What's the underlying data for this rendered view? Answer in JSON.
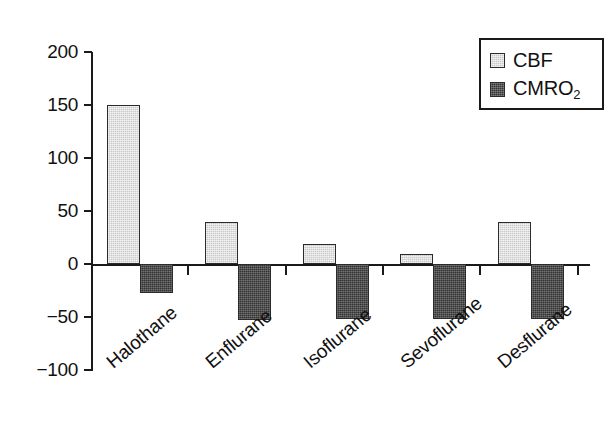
{
  "chart_data": {
    "type": "bar",
    "title": "",
    "subtitle": "",
    "xlabel": "",
    "ylabel": "",
    "categories": [
      "Halothane",
      "Enflurane",
      "Isoflurane",
      "Sevoflurane",
      "Desflurane"
    ],
    "series": [
      {
        "name": "CBF",
        "color": "#c9c9c9",
        "values": [
          150,
          40,
          19,
          9,
          40
        ]
      },
      {
        "name": "CMRO2",
        "color": "#333333",
        "values": [
          -27,
          -53,
          -52,
          -52,
          -52
        ]
      }
    ],
    "ylim": [
      -100,
      200
    ],
    "yticks": [
      200,
      150,
      100,
      50,
      0,
      -50,
      -100
    ],
    "ytick_labels": [
      "200",
      "150",
      "100",
      "50",
      "0",
      "−50",
      "−100"
    ],
    "grid": false,
    "legend": {
      "position": "top-right",
      "entries": [
        {
          "label": "CBF",
          "sub": "",
          "swatch": "light-gray"
        },
        {
          "label": "CMRO",
          "sub": "2",
          "swatch": "dark-gray"
        }
      ]
    },
    "annotations": [],
    "axis_colors": {
      "axis": "#1a1a1a",
      "text": "#111111",
      "background": "#ffffff"
    }
  }
}
